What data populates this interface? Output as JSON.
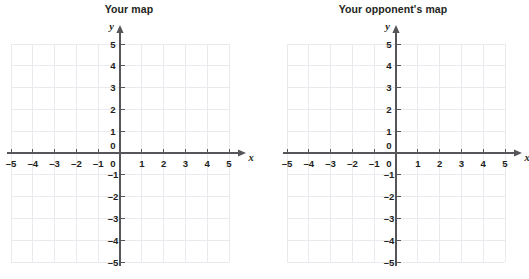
{
  "page": {
    "clipped_top_text": "Battleship",
    "background_color": "#ffffff",
    "grid_color": "#e9e9ee",
    "axis_color": "#55555a",
    "label_color": "#231f20"
  },
  "panels": [
    {
      "title": "Your map",
      "chart_data": {
        "type": "scatter",
        "title": "Your map",
        "xlabel": "x",
        "ylabel": "y",
        "xlim": [
          -5,
          5
        ],
        "ylim": [
          -5,
          5
        ],
        "x_ticks": [
          "–5",
          "–4",
          "–3",
          "–2",
          "–1",
          "0",
          "1",
          "2",
          "3",
          "4",
          "5"
        ],
        "y_ticks": [
          "–5",
          "–4",
          "–3",
          "–2",
          "–1",
          "0",
          "1",
          "2",
          "3",
          "4",
          "5"
        ],
        "x_tick_values": [
          -5,
          -4,
          -3,
          -2,
          -1,
          0,
          1,
          2,
          3,
          4,
          5
        ],
        "y_tick_values": [
          -5,
          -4,
          -3,
          -2,
          -1,
          0,
          1,
          2,
          3,
          4,
          5
        ],
        "grid": true,
        "legend": false,
        "series": [],
        "points": [],
        "annotations": []
      }
    },
    {
      "title": "Your opponent's map",
      "chart_data": {
        "type": "scatter",
        "title": "Your opponent's map",
        "xlabel": "x",
        "ylabel": "y",
        "xlim": [
          -5,
          5
        ],
        "ylim": [
          -5,
          5
        ],
        "x_ticks": [
          "–5",
          "–4",
          "–3",
          "–2",
          "–1",
          "0",
          "1",
          "2",
          "3",
          "4",
          "5"
        ],
        "y_ticks": [
          "–5",
          "–4",
          "–3",
          "–2",
          "–1",
          "0",
          "1",
          "2",
          "3",
          "4",
          "5"
        ],
        "x_tick_values": [
          -5,
          -4,
          -3,
          -2,
          -1,
          0,
          1,
          2,
          3,
          4,
          5
        ],
        "y_tick_values": [
          -5,
          -4,
          -3,
          -2,
          -1,
          0,
          1,
          2,
          3,
          4,
          5
        ],
        "grid": true,
        "legend": false,
        "series": [],
        "points": [],
        "annotations": []
      }
    }
  ]
}
